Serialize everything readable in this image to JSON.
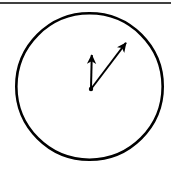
{
  "figure": {
    "caption": "",
    "background_color": "#ffffff",
    "ink_color": "#000000",
    "width": 178,
    "height": 173
  },
  "chart_data": {
    "type": "scatter",
    "title": "",
    "subtitle": "",
    "xlabel": "",
    "ylabel": "",
    "grid": false,
    "legend_position": "none",
    "xlim": [
      0,
      178
    ],
    "ylim": [
      0,
      173
    ],
    "description": "Outline circle with two vectors drawn from a common origin slightly below the circle centre; one vector points vertically upward, the other points up and to the right at roughly 45 degrees.",
    "shapes": [
      {
        "name": "boundary-circle",
        "kind": "circle",
        "center_x": 89.5,
        "center_y": 86.5,
        "radius": 73.5,
        "fill": "none",
        "stroke": "#000000",
        "stroke_width": 2.6
      },
      {
        "name": "top-rule",
        "kind": "line",
        "x1": 0,
        "y1": 3,
        "x2": 171,
        "y2": 3,
        "stroke": "#000000",
        "stroke_width": 1.6
      }
    ],
    "vectors": [
      {
        "name": "vertical-vector",
        "label": "",
        "origin_x": 91,
        "origin_y": 89,
        "tip_x": 92,
        "tip_y": 45,
        "length": 44,
        "angle_deg": 90,
        "stroke": "#000000",
        "stroke_width": 2.0,
        "arrowhead": "solid-triangle"
      },
      {
        "name": "diagonal-vector",
        "label": "",
        "origin_x": 91,
        "origin_y": 89,
        "tip_x": 132,
        "tip_y": 35,
        "length": 68,
        "angle_deg": 53,
        "stroke": "#000000",
        "stroke_width": 2.0,
        "arrowhead": "solid-triangle"
      }
    ],
    "origin_point": {
      "name": "vector-origin",
      "x": 91,
      "y": 89,
      "radius": 2.2,
      "fill": "#000000"
    },
    "annotations": []
  }
}
